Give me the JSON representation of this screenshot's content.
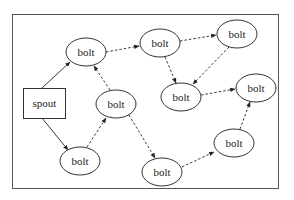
{
  "diagram": {
    "type": "storm-topology",
    "nodes": [
      {
        "id": "spout",
        "label": "spout",
        "shape": "rect",
        "x": 23,
        "y": 88,
        "w": 42,
        "h": 30
      },
      {
        "id": "b1",
        "label": "bolt",
        "shape": "ellipse",
        "cx": 86,
        "cy": 52
      },
      {
        "id": "b2",
        "label": "bolt",
        "shape": "ellipse",
        "cx": 160,
        "cy": 43
      },
      {
        "id": "b3",
        "label": "bolt",
        "shape": "ellipse",
        "cx": 237,
        "cy": 34
      },
      {
        "id": "b4",
        "label": "bolt",
        "shape": "ellipse",
        "cx": 181,
        "cy": 97
      },
      {
        "id": "b5",
        "label": "bolt",
        "shape": "ellipse",
        "cx": 256,
        "cy": 88
      },
      {
        "id": "b6",
        "label": "bolt",
        "shape": "ellipse",
        "cx": 116,
        "cy": 104
      },
      {
        "id": "b7",
        "label": "bolt",
        "shape": "ellipse",
        "cx": 80,
        "cy": 161
      },
      {
        "id": "b8",
        "label": "bolt",
        "shape": "ellipse",
        "cx": 162,
        "cy": 172
      },
      {
        "id": "b9",
        "label": "bolt",
        "shape": "ellipse",
        "cx": 234,
        "cy": 143
      }
    ],
    "edges": [
      {
        "from": "spout",
        "to": "b1",
        "style": "solid"
      },
      {
        "from": "spout",
        "to": "b7",
        "style": "solid"
      },
      {
        "from": "b1",
        "to": "b2",
        "style": "dashed"
      },
      {
        "from": "b2",
        "to": "b3",
        "style": "dashed"
      },
      {
        "from": "b2",
        "to": "b4",
        "style": "dashed"
      },
      {
        "from": "b3",
        "to": "b4",
        "style": "dashed"
      },
      {
        "from": "b4",
        "to": "b5",
        "style": "dashed"
      },
      {
        "from": "b6",
        "to": "b1",
        "style": "dashed"
      },
      {
        "from": "b7",
        "to": "b6",
        "style": "dashed"
      },
      {
        "from": "b6",
        "to": "b8",
        "style": "dashed"
      },
      {
        "from": "b8",
        "to": "b9",
        "style": "dashed"
      },
      {
        "from": "b9",
        "to": "b5",
        "style": "dashed"
      }
    ]
  }
}
